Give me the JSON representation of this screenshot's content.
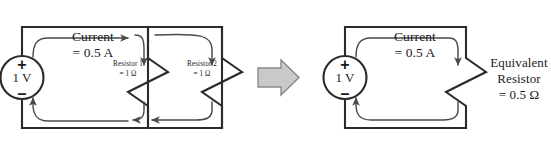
{
  "figure": {
    "background_color": "#ffffff",
    "wire_color": "#2b2b2b",
    "flow_arrow_color": "#4a4a4a",
    "block_arrow_fill": "#c9c9c9",
    "block_arrow_stroke": "#8a8a8a"
  },
  "left_circuit": {
    "name": "parallel-resistor-circuit",
    "source": {
      "value_label": "1 V",
      "plus_sign": "+",
      "minus_sign": "–"
    },
    "current": {
      "line1": "Current",
      "line2": "= 0.5 A"
    },
    "resistors": [
      {
        "name_label": "Resistor 1",
        "value_label": "= 1 Ω"
      },
      {
        "name_label": "Resistor 2",
        "value_label": "= 1 Ω"
      }
    ]
  },
  "transform_arrow": {
    "name": "equivalence-arrow",
    "direction": "right"
  },
  "right_circuit": {
    "name": "equivalent-resistor-circuit",
    "source": {
      "value_label": "1 V",
      "plus_sign": "+",
      "minus_sign": "–"
    },
    "current": {
      "line1": "Current",
      "line2": "= 0.5 A"
    },
    "resistor": {
      "line1": "Equivalent",
      "line2": "Resistor",
      "line3": "= 0.5 Ω"
    }
  }
}
